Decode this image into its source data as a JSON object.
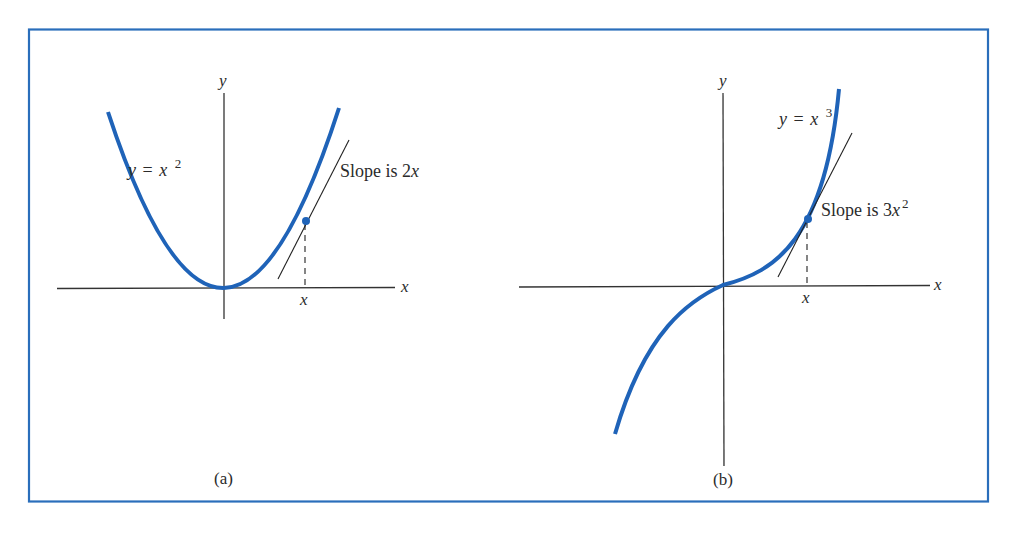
{
  "figure": {
    "frame_color": "#2a6ebb",
    "curve_color": "#1f63b8",
    "axis_color": "#333333",
    "panels": [
      {
        "id": "a",
        "caption": "(a)",
        "y_axis_label": "y",
        "x_axis_label": "x",
        "x_tick_label": "x",
        "curve_label_lhs": "y",
        "curve_label_eq": "=",
        "curve_label_base": "x",
        "curve_label_exp": "2",
        "tangent_label_prefix": "Slope is 2",
        "tangent_label_var": "x"
      },
      {
        "id": "b",
        "caption": "(b)",
        "y_axis_label": "y",
        "x_axis_label": "x",
        "x_tick_label": "x",
        "curve_label_lhs": "y",
        "curve_label_eq": "=",
        "curve_label_base": "x",
        "curve_label_exp": "3",
        "tangent_label_prefix": "Slope is 3",
        "tangent_label_var": "x",
        "tangent_label_exp": "2"
      }
    ]
  }
}
